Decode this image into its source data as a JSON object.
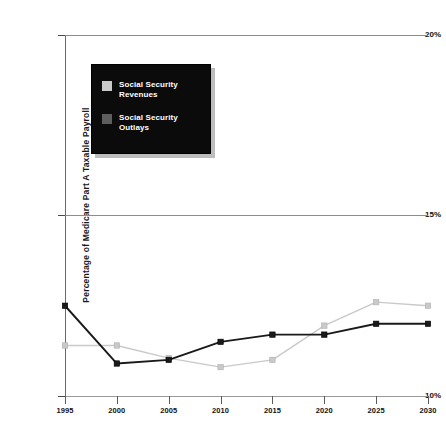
{
  "chart_data": {
    "type": "line",
    "title": "",
    "xlabel": "",
    "ylabel": "Percentage of Medicare Part A Taxable Payroll",
    "x": [
      1995,
      2000,
      2005,
      2010,
      2015,
      2020,
      2025,
      2030
    ],
    "categories": [
      "1995",
      "2000",
      "2005",
      "2010",
      "2015",
      "2020",
      "2025",
      "2030"
    ],
    "xtick_labels": [
      "1995",
      "2000",
      "2005",
      "2010",
      "2015",
      "2020",
      "2025",
      "2030"
    ],
    "ytick_labels": [
      "20%",
      "15%",
      "10%"
    ],
    "ytick_values": [
      20,
      15,
      10
    ],
    "ylim": [
      10,
      20
    ],
    "xlim": [
      1995,
      2030
    ],
    "grid": true,
    "legend_position": "upper-left-inset",
    "series": [
      {
        "name": "Social Security Revenues",
        "color": "#c9c9c9",
        "marker": "square",
        "values": [
          11.4,
          11.4,
          11.05,
          10.8,
          11.0,
          11.95,
          12.6,
          12.5
        ]
      },
      {
        "name": "Social Security Outlays",
        "color": "#1a1a1a",
        "marker": "square",
        "values": [
          12.5,
          10.9,
          11.0,
          11.5,
          11.7,
          11.7,
          12.0,
          12.0
        ]
      }
    ]
  },
  "axes": {
    "y_title": "Percentage of Medicare Part A Taxable Payroll",
    "y_ticks": [
      {
        "label": "20%",
        "value": 20
      },
      {
        "label": "15%",
        "value": 15
      },
      {
        "label": "10%",
        "value": 10
      }
    ],
    "x_ticks": [
      {
        "label": "1995",
        "value": 1995
      },
      {
        "label": "2000",
        "value": 2000
      },
      {
        "label": "2005",
        "value": 2005
      },
      {
        "label": "2010",
        "value": 2010
      },
      {
        "label": "2015",
        "value": 2015
      },
      {
        "label": "2020",
        "value": 2020
      },
      {
        "label": "2025",
        "value": 2025
      },
      {
        "label": "2030",
        "value": 2030
      }
    ]
  },
  "legend": {
    "background": "#0b0b0b",
    "entries": [
      {
        "label": "Social Security\nRevenues",
        "color": "#c9c9c9"
      },
      {
        "label": "Social Security\nOutlays",
        "color": "#5e5e5e"
      }
    ]
  }
}
